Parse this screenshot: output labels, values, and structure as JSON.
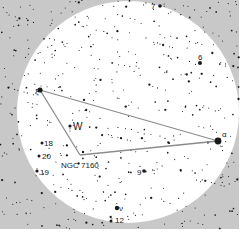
{
  "chart": {
    "width": 247,
    "height": 242,
    "field": {
      "x": 0,
      "y": 0,
      "w": 239,
      "h": 229,
      "color": "#c8c8c8"
    },
    "circle": {
      "cx": 128,
      "cy": 112,
      "r": 111,
      "color": "#ffffff"
    },
    "colors": {
      "star": "#1a1a1a",
      "line": "#8c8c8c",
      "label": "#222222"
    }
  },
  "asterism": {
    "lines": [
      {
        "from": [
          40,
          90
        ],
        "to": [
          218,
          141
        ]
      },
      {
        "from": [
          40,
          90
        ],
        "to": [
          80,
          155
        ]
      },
      {
        "from": [
          80,
          155
        ],
        "to": [
          218,
          141
        ]
      }
    ]
  },
  "labels": [
    {
      "text": "7",
      "x": 151,
      "y": 9,
      "size": 8
    },
    {
      "text": "6",
      "x": 198,
      "y": 60,
      "size": 8
    },
    {
      "text": "ξ",
      "x": 35,
      "y": 94,
      "size": 8
    },
    {
      "text": "α",
      "x": 222,
      "y": 137,
      "size": 8
    },
    {
      "text": "W",
      "x": 73,
      "y": 130,
      "size": 10
    },
    {
      "text": "18",
      "x": 44,
      "y": 146,
      "size": 8
    },
    {
      "text": "20",
      "x": 42,
      "y": 159,
      "size": 8
    },
    {
      "text": "19",
      "x": 40,
      "y": 175,
      "size": 8
    },
    {
      "text": "NGC 7160",
      "x": 61,
      "y": 168,
      "size": 8
    },
    {
      "text": "9",
      "x": 137,
      "y": 175,
      "size": 8
    },
    {
      "text": "ν",
      "x": 119,
      "y": 211,
      "size": 8
    },
    {
      "text": "12",
      "x": 115,
      "y": 223,
      "size": 8
    }
  ],
  "bright_stars": [
    {
      "name": "xi",
      "x": 40,
      "y": 90,
      "r": 2.6
    },
    {
      "name": "alpha",
      "x": 218,
      "y": 141,
      "r": 3.4
    },
    {
      "name": "W",
      "x": 70,
      "y": 126,
      "r": 1.6
    },
    {
      "name": "18",
      "x": 42,
      "y": 143,
      "r": 1.5
    },
    {
      "name": "20",
      "x": 39,
      "y": 156,
      "r": 1.5
    },
    {
      "name": "19",
      "x": 37,
      "y": 171,
      "r": 1.6
    },
    {
      "name": "9",
      "x": 144,
      "y": 171,
      "r": 1.8
    },
    {
      "name": "nu",
      "x": 117,
      "y": 208,
      "r": 2.2
    },
    {
      "name": "12",
      "x": 111,
      "y": 221,
      "r": 1.5
    },
    {
      "name": "7",
      "x": 160,
      "y": 6,
      "r": 1.8
    },
    {
      "name": "6",
      "x": 200,
      "y": 63,
      "r": 2.0
    },
    {
      "name": "cluster",
      "x": 83,
      "y": 152,
      "r": 1.2
    }
  ]
}
